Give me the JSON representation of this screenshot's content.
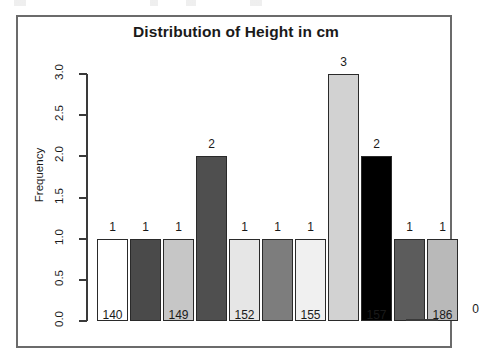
{
  "chart_data": {
    "type": "bar",
    "title": "Distribution of Height in cm",
    "xlabel": "",
    "ylabel": "Frequency",
    "ylim": [
      0.0,
      3.0
    ],
    "grid": false,
    "legend": false,
    "y_ticks": [
      "0.0",
      "0.5",
      "1.0",
      "1.5",
      "2.0",
      "2.5",
      "3.0"
    ],
    "y_tick_values": [
      0.0,
      0.5,
      1.0,
      1.5,
      2.0,
      2.5,
      3.0
    ],
    "x_tick_labels": [
      "140",
      "149",
      "152",
      "155",
      "157",
      "186"
    ],
    "categories": [
      "140",
      "",
      "149",
      "",
      "152",
      "",
      "155",
      "",
      "157",
      "",
      "186",
      ""
    ],
    "values": [
      1,
      1,
      1,
      2,
      1,
      1,
      1,
      3,
      2,
      1,
      1,
      0
    ],
    "bars": [
      {
        "label": "140",
        "value": 1,
        "value_text": "1",
        "fill": "#ffffff",
        "x": 79,
        "width": 31,
        "show_tick": true
      },
      {
        "label": "",
        "value": 1,
        "value_text": "1",
        "fill": "#4a4a4a",
        "x": 112,
        "width": 31,
        "show_tick": false
      },
      {
        "label": "149",
        "value": 1,
        "value_text": "1",
        "fill": "#c6c6c6",
        "x": 145,
        "width": 31,
        "show_tick": true
      },
      {
        "label": "",
        "value": 2,
        "value_text": "2",
        "fill": "#4f4f4f",
        "x": 178,
        "width": 31,
        "show_tick": false
      },
      {
        "label": "152",
        "value": 1,
        "value_text": "1",
        "fill": "#e6e6e6",
        "x": 211,
        "width": 31,
        "show_tick": true
      },
      {
        "label": "",
        "value": 1,
        "value_text": "1",
        "fill": "#7d7d7d",
        "x": 244,
        "width": 31,
        "show_tick": false
      },
      {
        "label": "155",
        "value": 1,
        "value_text": "1",
        "fill": "#f0f0f0",
        "x": 277,
        "width": 31,
        "show_tick": true
      },
      {
        "label": "",
        "value": 3,
        "value_text": "3",
        "fill": "#d2d2d2",
        "x": 310,
        "width": 31,
        "show_tick": false
      },
      {
        "label": "157",
        "value": 2,
        "value_text": "2",
        "fill": "#000000",
        "x": 343,
        "width": 31,
        "show_tick": true
      },
      {
        "label": "",
        "value": 1,
        "value_text": "1",
        "fill": "#5c5c5c",
        "x": 376,
        "width": 31,
        "show_tick": false
      },
      {
        "label": "186",
        "value": 1,
        "value_text": "1",
        "fill": "#b9b9b9",
        "x": 409,
        "width": 31,
        "show_tick": true
      },
      {
        "label": "",
        "value": 0,
        "value_text": "0",
        "fill": "none",
        "x": 442,
        "width": 31,
        "show_tick": false
      }
    ]
  }
}
